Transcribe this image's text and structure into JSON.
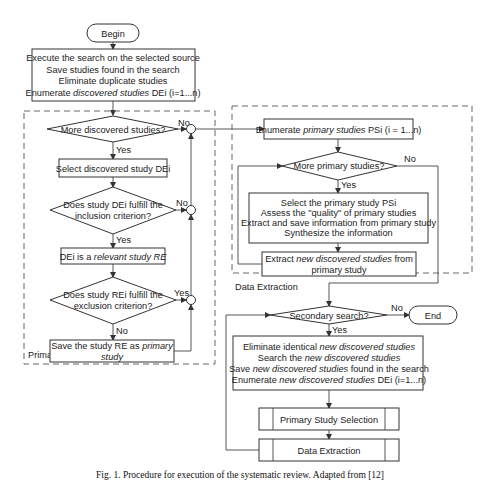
{
  "diagram": {
    "begin": "Begin",
    "end": "End",
    "start_box": {
      "line1": "Execute the search on the selected source",
      "line2": "Save studies found in the search",
      "line3": "Eliminate duplicate studies",
      "line4_pre": "Enumerate ",
      "line4_italic": "discovered studies",
      "line4_post": " DEi (i=1...n)"
    },
    "primary_selection": {
      "group_label": "Primary Study Selection",
      "more_discovered": "More discovered studies?",
      "select_discovered": "Select discovered study DEi",
      "inclusion_q_line1": "Does study DEi fulfill the",
      "inclusion_q_line2": "inclusion criterion?",
      "relevant_pre": "DEi is a ",
      "relevant_italic": "relevant study RE",
      "exclusion_q_line1": "Does study REi fulfill the",
      "exclusion_q_line2": "exclusion criterion?",
      "save_pre": "Save the study RE as ",
      "save_italic1": "primary",
      "save_italic2": "study"
    },
    "data_extraction": {
      "group_label": "Data Extraction",
      "enumerate_pre": "Enumerate ",
      "enumerate_italic": "primary studies",
      "enumerate_post": " PSi (i = 1...n)",
      "more_primary": "More primary studies?",
      "process_line1": "Select the primary study PSi",
      "process_line2": "Assess the \"quality\" of primary studies",
      "process_line3": "Extract and save information from primary study",
      "process_line4": "Synthesize the information",
      "extract_pre": "Extract ",
      "extract_italic": "new discovered studies",
      "extract_post": " from",
      "extract_line2": "primary study"
    },
    "secondary": {
      "question": "Secondary search?",
      "line1_pre": "Eliminate identical ",
      "line1_italic": "new discovered studies",
      "line2_pre": "Search the ",
      "line2_italic": "new discovered studies",
      "line3_pre": "Save ",
      "line3_italic": "new discovered studies",
      "line3_post": " found in the search",
      "line4_pre": "Enumerate ",
      "line4_italic": "new discovered studies",
      "line4_post": " DEi (i=1...n)",
      "subprocess1": "Primary Study Selection",
      "subprocess2": "Data Extraction"
    },
    "labels": {
      "yes": "Yes",
      "no": "No"
    },
    "caption": "Fig. 1.  Procedure for execution of the systematic review. Adapted from [12]"
  }
}
